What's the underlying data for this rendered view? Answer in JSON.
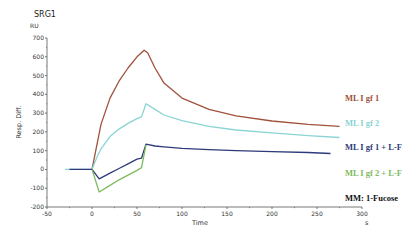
{
  "chart_data": {
    "type": "line",
    "title": "SRG1",
    "xlabel": "Time",
    "xunit": "s",
    "ylabel": "Resp. Diff.",
    "yunit": "RU",
    "xlim": [
      -50,
      300
    ],
    "ylim": [
      -200,
      700
    ],
    "xticks": [
      -50,
      0,
      50,
      100,
      150,
      200,
      250,
      300
    ],
    "yticks": [
      -200,
      -100,
      0,
      100,
      200,
      300,
      400,
      500,
      600,
      700
    ],
    "grid": false,
    "legend_position": "right",
    "annotation": "MM: 1-Fucose",
    "series": [
      {
        "name": "ML I gf 1",
        "color": "#a0523c",
        "x": [
          0,
          5,
          10,
          20,
          30,
          40,
          50,
          58,
          62,
          70,
          80,
          100,
          130,
          160,
          200,
          240,
          275
        ],
        "y": [
          0,
          120,
          240,
          380,
          470,
          540,
          600,
          635,
          620,
          540,
          460,
          380,
          320,
          285,
          258,
          240,
          230
        ]
      },
      {
        "name": "ML I gf 2",
        "color": "#8ad4d4",
        "x": [
          -30,
          0,
          5,
          10,
          20,
          30,
          40,
          50,
          55,
          60,
          70,
          80,
          100,
          130,
          160,
          200,
          240,
          275
        ],
        "y": [
          0,
          0,
          60,
          110,
          175,
          215,
          245,
          270,
          280,
          350,
          320,
          290,
          260,
          230,
          210,
          195,
          180,
          170
        ]
      },
      {
        "name": "ML I gf 1 + L-F",
        "color": "#2e3a7a",
        "x": [
          -25,
          0,
          8,
          20,
          30,
          40,
          50,
          55,
          60,
          70,
          80,
          100,
          130,
          160,
          200,
          240,
          265
        ],
        "y": [
          0,
          0,
          -50,
          -20,
          5,
          30,
          55,
          60,
          135,
          125,
          120,
          112,
          105,
          100,
          95,
          90,
          85
        ]
      },
      {
        "name": "ML I gf 2 + L-F",
        "color": "#7dbb5e",
        "x": [
          0,
          8,
          20,
          30,
          40,
          50,
          55,
          60
        ],
        "y": [
          0,
          -120,
          -85,
          -55,
          -30,
          -5,
          10,
          130
        ]
      }
    ]
  }
}
